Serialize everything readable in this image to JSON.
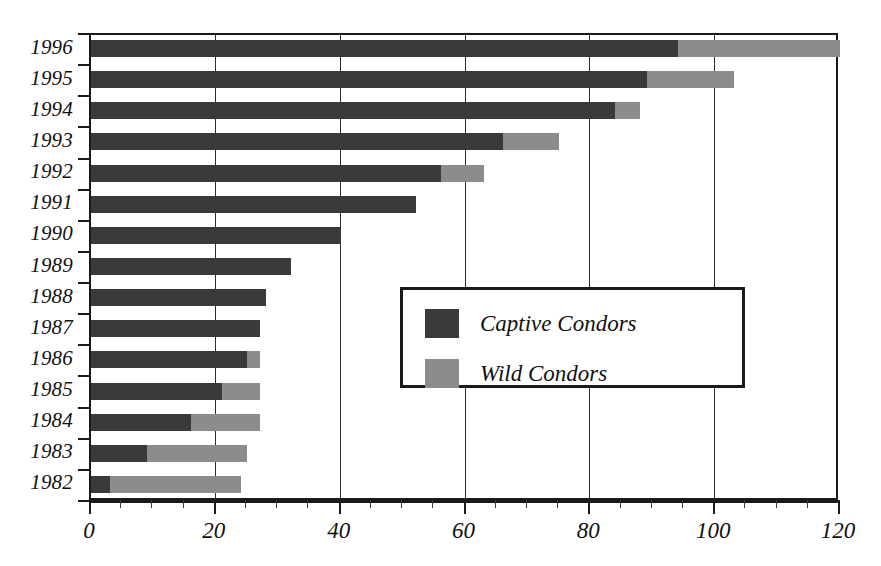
{
  "chart_data": {
    "type": "bar",
    "orientation": "horizontal",
    "stacked": true,
    "title": "",
    "subtitle": "",
    "xlabel": "",
    "ylabel": "",
    "xlim": [
      0,
      120
    ],
    "ylim": null,
    "grid": true,
    "grid_axis": "x",
    "legend_position": "center-right-inside",
    "categories": [
      "1996",
      "1995",
      "1994",
      "1993",
      "1992",
      "1991",
      "1990",
      "1989",
      "1988",
      "1987",
      "1986",
      "1985",
      "1984",
      "1983",
      "1982"
    ],
    "series": [
      {
        "name": "Captive Condors",
        "color": "#3a3a3a",
        "values": [
          94,
          89,
          84,
          66,
          56,
          52,
          40,
          32,
          28,
          27,
          25,
          21,
          16,
          9,
          3
        ]
      },
      {
        "name": "Wild Condors",
        "color": "#8c8c8c",
        "values": [
          26,
          14,
          4,
          9,
          7,
          0,
          0,
          0,
          0,
          0,
          2,
          6,
          11,
          16,
          21
        ]
      }
    ],
    "totals": [
      120,
      103,
      88,
      75,
      63,
      52,
      40,
      32,
      28,
      27,
      27,
      27,
      27,
      25,
      24
    ],
    "x_ticks_major": [
      0,
      20,
      40,
      60,
      80,
      100,
      120
    ],
    "x_tick_labels": [
      "0",
      "20",
      "40",
      "60",
      "80",
      "100",
      "120"
    ],
    "x_tick_minor_step": 5,
    "gridlines_at": [
      20,
      40,
      60,
      80,
      100
    ]
  },
  "legend": {
    "entries": [
      {
        "label": "Captive Condors",
        "color": "#3a3a3a",
        "swatch_name": "legend-swatch-captive"
      },
      {
        "label": "Wild Condors",
        "color": "#8c8c8c",
        "swatch_name": "legend-swatch-wild"
      }
    ]
  },
  "colors": {
    "captive": "#3a3a3a",
    "wild": "#8c8c8c",
    "axis": "#1a1a1a",
    "grid": "#2b2b2b",
    "background": "#ffffff",
    "text": "#111111"
  }
}
